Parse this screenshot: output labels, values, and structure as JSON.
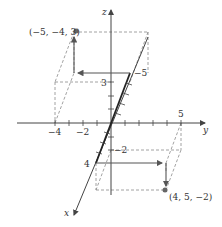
{
  "diagram": {
    "title": "",
    "axes": {
      "x_label": "x",
      "y_label": "y",
      "z_label": "z"
    },
    "tick_labels": {
      "y_neg4": "−4",
      "y_neg2": "−2",
      "y_5": "5",
      "z_3": "3",
      "z_neg2": "−2",
      "x_4": "4",
      "x_neg5": "−5"
    },
    "points": [
      {
        "label": "(−5, −4, 3)",
        "x": -5,
        "y": -4,
        "z": 3
      },
      {
        "label": "(4, 5, −2)",
        "x": 4,
        "y": 5,
        "z": -2
      }
    ],
    "colors": {
      "axis": "#333333",
      "dashed": "#888888",
      "arrow": "#555555",
      "point": "#666666"
    }
  }
}
